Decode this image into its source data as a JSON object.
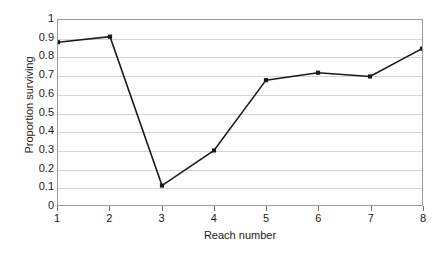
{
  "chart_data": {
    "type": "line",
    "title": "",
    "xlabel": "Reach number",
    "ylabel": "Proportion surviving",
    "x": [
      1,
      2,
      3,
      4,
      5,
      6,
      7,
      8
    ],
    "values": [
      0.88,
      0.91,
      0.105,
      0.295,
      0.675,
      0.715,
      0.695,
      0.845
    ],
    "categories": [
      "1",
      "2",
      "3",
      "4",
      "5",
      "6",
      "7",
      "8"
    ],
    "xlim": [
      1,
      8
    ],
    "ylim": [
      0,
      1
    ],
    "x_tick_labels": [
      "1",
      "2",
      "3",
      "4",
      "5",
      "6",
      "7",
      "8"
    ],
    "y_tick_labels": [
      "0",
      "0.1",
      "0.2",
      "0.3",
      "0.4",
      "0.5",
      "0.6",
      "0.7",
      "0.8",
      "0.9",
      "1"
    ],
    "y_tick_values": [
      0,
      0.1,
      0.2,
      0.3,
      0.4,
      0.5,
      0.6,
      0.7,
      0.8,
      0.9,
      1
    ],
    "grid": true,
    "grid_axis": "y",
    "legend": false,
    "legend_position": "none",
    "marker": "square",
    "series_color": "#1a1a1a",
    "gridline_color": "#d4d4d4",
    "frame_color": "#9a9a9a",
    "background_color": "#ffffff"
  }
}
